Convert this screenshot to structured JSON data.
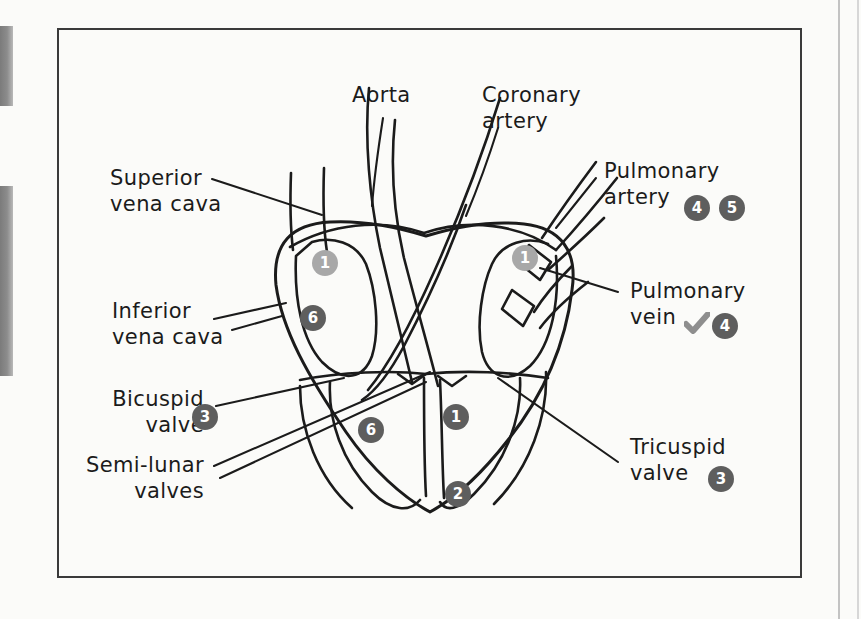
{
  "figure": {
    "title_hidden": "",
    "background_color": "#fbfbf9",
    "frame_color": "#3a3a3a",
    "ink_color": "#1b1b1b",
    "badge_dark_color": "#5e5e5e",
    "badge_light_color": "#a8a8a8",
    "tick_color": "#8e8e8e"
  },
  "labels": {
    "aorta": {
      "line1": "Aorta"
    },
    "coronary_artery": {
      "line1": "Coronary",
      "line2": "artery"
    },
    "superior_vena_cava": {
      "line1": "Superior",
      "line2": "vena cava"
    },
    "inferior_vena_cava": {
      "line1": "Inferior",
      "line2": "vena cava"
    },
    "bicuspid_valve": {
      "line1": "Bicuspid",
      "line2": "valve",
      "badge": "3"
    },
    "semi_lunar_valves": {
      "line1": "Semi-lunar",
      "line2": "valves"
    },
    "pulmonary_artery": {
      "line1": "Pulmonary",
      "line2": "artery",
      "badge_a": "4",
      "badge_b": "5"
    },
    "pulmonary_vein": {
      "line1": "Pulmonary",
      "line2": "vein",
      "badge": "4",
      "tick": "check-mark"
    },
    "tricuspid_valve": {
      "line1": "Tricuspid",
      "line2": "valve",
      "badge": "3"
    }
  },
  "diagram_badges": [
    {
      "id": "left-atrium-top",
      "value": "1",
      "tone": "light",
      "x": 312,
      "y": 250
    },
    {
      "id": "left-atrium-lower",
      "value": "6",
      "tone": "dark",
      "x": 300,
      "y": 305
    },
    {
      "id": "right-atrium-top",
      "value": "1",
      "tone": "light",
      "x": 512,
      "y": 245
    },
    {
      "id": "left-ventricle",
      "value": "6",
      "tone": "dark",
      "x": 358,
      "y": 417
    },
    {
      "id": "right-ventricle",
      "value": "1",
      "tone": "dark",
      "x": 443,
      "y": 404
    },
    {
      "id": "apex",
      "value": "2",
      "tone": "dark",
      "x": 445,
      "y": 481
    }
  ],
  "edge_tabs": [
    {
      "id": "tab-top",
      "top": 26,
      "height": 80
    },
    {
      "id": "tab-bottom",
      "top": 186,
      "height": 190
    }
  ]
}
